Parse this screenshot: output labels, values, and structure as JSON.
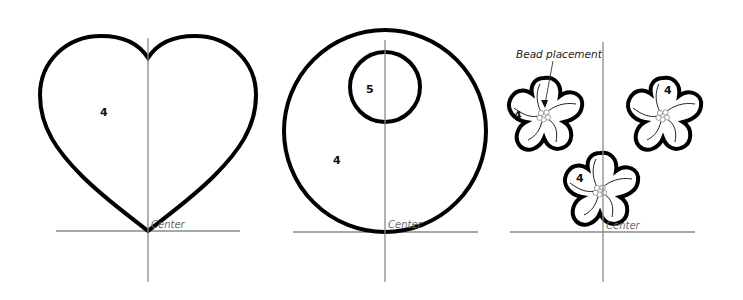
{
  "diagram": {
    "panels": [
      {
        "id": "heart",
        "shape": "heart",
        "region_labels": [
          "4"
        ],
        "axis_label": "Center"
      },
      {
        "id": "circle",
        "shape": "circle-with-inner-circle",
        "region_labels": [
          "5",
          "4"
        ],
        "axis_label": "Center"
      },
      {
        "id": "flowers",
        "shape": "three-five-petal-flowers",
        "region_labels": [
          "4",
          "4",
          "4"
        ],
        "axis_label": "Center",
        "callout": "Bead placement"
      }
    ],
    "colors": {
      "outline": "#000000",
      "axis": "#8a8a8a",
      "bead": "#9a9a9a",
      "center_label": "#6a6a6a"
    }
  }
}
